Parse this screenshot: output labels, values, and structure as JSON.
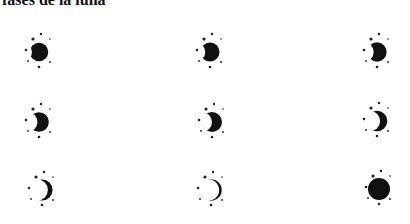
{
  "title": "fases de la luna",
  "colors": {
    "moon": "#111111",
    "star": "#222222",
    "background": "#ffffff"
  },
  "moons": [
    {
      "id": 1,
      "phase": "thin-crescent",
      "fill": 0.12,
      "cx": 39,
      "cy": 52
    },
    {
      "id": 2,
      "phase": "crescent",
      "fill": 0.25,
      "cx": 210,
      "cy": 52
    },
    {
      "id": 3,
      "phase": "crescent",
      "fill": 0.33,
      "cx": 377,
      "cy": 52
    },
    {
      "id": 4,
      "phase": "crescent",
      "fill": 0.42,
      "cx": 39,
      "cy": 122
    },
    {
      "id": 5,
      "phase": "crescent",
      "fill": 0.5,
      "cx": 212,
      "cy": 122
    },
    {
      "id": 6,
      "phase": "gibbous",
      "fill": 0.65,
      "cx": 377,
      "cy": 121
    },
    {
      "id": 7,
      "phase": "gibbous",
      "fill": 0.78,
      "cx": 42,
      "cy": 190
    },
    {
      "id": 8,
      "phase": "gibbous",
      "fill": 0.88,
      "cx": 211,
      "cy": 190
    },
    {
      "id": 9,
      "phase": "full-moon",
      "fill": 1.0,
      "cx": 379,
      "cy": 189
    }
  ]
}
